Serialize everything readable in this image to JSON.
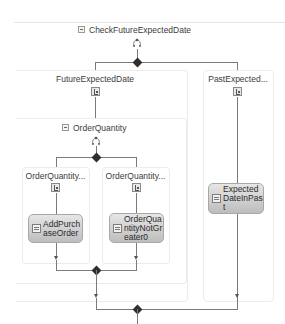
{
  "workflow": {
    "root": {
      "title": "CheckFutureExpectedDate",
      "kind": "parallel",
      "icon": "parallel-icon",
      "branches": [
        {
          "title": "FutureExpectedDate",
          "kind": "sequence",
          "icon": "sequence-icon",
          "child": {
            "title": "OrderQuantity",
            "kind": "parallel",
            "icon": "parallel-icon",
            "branches": [
              {
                "title": "OrderQuantity...",
                "kind": "sequence",
                "icon": "sequence-icon",
                "activity": {
                  "label": "AddPurchaseOrder",
                  "icon": "code-activity-icon"
                }
              },
              {
                "title": "OrderQuantity...",
                "kind": "sequence",
                "icon": "sequence-icon",
                "activity": {
                  "label": "OrderQuantityNotGreater0",
                  "icon": "code-activity-icon"
                }
              }
            ]
          }
        },
        {
          "title": "PastExpected...",
          "kind": "sequence",
          "icon": "sequence-icon",
          "activity": {
            "label": "ExpectedDateInPast",
            "icon": "code-activity-icon"
          }
        }
      ]
    }
  },
  "colors": {
    "connector": "#7a7a7a",
    "diamond": "#2f2f2f",
    "frame_border": "#ececec",
    "activity_top": "#e6e6e6",
    "activity_bottom": "#bdbdbd"
  }
}
